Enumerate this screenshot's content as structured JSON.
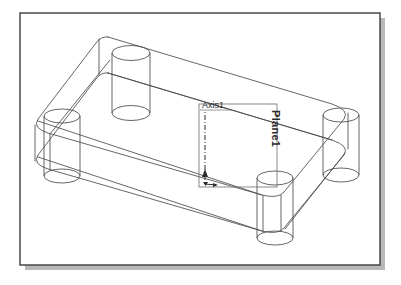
{
  "app": {
    "view_title": "CAD Isometric Wireframe View",
    "background_color": "#ffffff",
    "frame_border_color": "#3d3d3d",
    "frame_shadow_color": "#b9b9b9",
    "line_color": "#4a4a4a",
    "label_color": "#2b2b2b"
  },
  "frame": {
    "x": 20,
    "y": 13,
    "width": 360,
    "height": 252,
    "shadow_offset": 5
  },
  "model": {
    "name": "rounded-rectangular-plate-with-four-bosses",
    "description": "Isometric wireframe of a rounded rectangular plate with four cylindrical bosses at the corners",
    "boss_count": 4,
    "projection": "isometric"
  },
  "annotations": {
    "axis": {
      "label": "Axis1",
      "label_x": 202,
      "label_y": 106,
      "line_style": "dash-dot",
      "arrow": "up",
      "top_x": 205,
      "top_y": 112,
      "bottom_x": 205,
      "bottom_y": 178
    },
    "plane": {
      "label": "Plane1",
      "label_x": 272,
      "label_y": 110,
      "rotation_deg": 90,
      "rect_x": 199,
      "rect_y": 104,
      "rect_width": 78,
      "rect_height": 83
    },
    "origin": {
      "label": "",
      "x": 205,
      "y": 184,
      "secondary_arrow": "right"
    }
  },
  "geometry": {
    "plate_top": {
      "note": "top face outline of the plate, rounded corners",
      "corners": [
        {
          "name": "back",
          "x": 118,
          "y": 40
        },
        {
          "name": "right",
          "x": 348,
          "y": 112
        },
        {
          "name": "front",
          "x": 268,
          "y": 196
        },
        {
          "name": "left",
          "x": 46,
          "y": 122
        }
      ]
    },
    "plate_thickness_px": 36,
    "bosses": [
      {
        "name": "boss-back",
        "cx": 131,
        "cy": 58,
        "rx": 20,
        "ry": 8,
        "height": 60
      },
      {
        "name": "boss-left",
        "cx": 62,
        "cy": 122,
        "rx": 19,
        "ry": 8,
        "height": 60
      },
      {
        "name": "boss-right",
        "cx": 341,
        "cy": 115,
        "rx": 19,
        "ry": 8,
        "height": 60
      },
      {
        "name": "boss-front",
        "cx": 275,
        "cy": 177,
        "rx": 19,
        "ry": 8,
        "height": 60
      }
    ]
  }
}
